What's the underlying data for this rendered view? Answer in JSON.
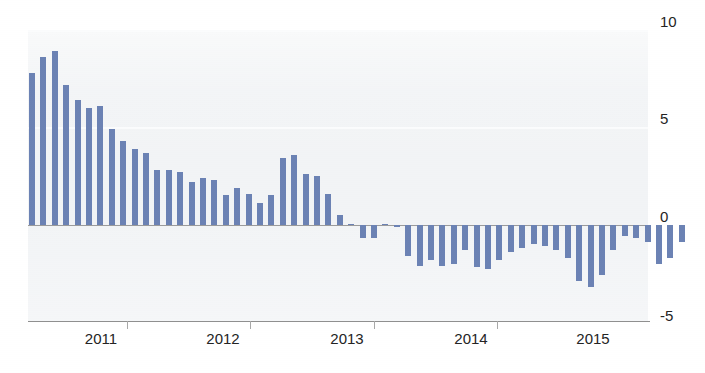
{
  "chart_data": {
    "type": "bar",
    "title": "",
    "subtitle": "",
    "xlabel": "",
    "ylabel": "",
    "ylim": [
      -5,
      10
    ],
    "yticks": [
      10,
      5,
      0,
      -5
    ],
    "ytick_labels": [
      "10",
      "5",
      "0",
      "-5"
    ],
    "xtick_labels": [
      "2011",
      "2012",
      "2013",
      "2014",
      "2015"
    ],
    "grid": "horizontal-light",
    "legend": "none",
    "series_color": "#6b82b4",
    "zero_line_color": "#9b9b9b",
    "panel_background": "#f2f4f6",
    "annotations": [],
    "n_points": 54,
    "x": [
      "2010-08",
      "2010-09",
      "2010-10",
      "2010-11",
      "2010-12",
      "2011-01",
      "2011-02",
      "2011-03",
      "2011-04",
      "2011-05",
      "2011-06",
      "2011-07",
      "2011-08",
      "2011-09",
      "2011-10",
      "2011-11",
      "2011-12",
      "2012-01",
      "2012-02",
      "2012-03",
      "2012-04",
      "2012-05",
      "2012-06",
      "2012-07",
      "2012-08",
      "2012-09",
      "2012-10",
      "2012-11",
      "2012-12",
      "2013-01",
      "2013-02",
      "2013-03",
      "2013-04",
      "2013-05",
      "2013-06",
      "2013-07",
      "2013-08",
      "2013-09",
      "2013-10",
      "2013-11",
      "2013-12",
      "2014-01",
      "2014-02",
      "2014-03",
      "2014-04",
      "2014-05",
      "2014-06",
      "2014-07",
      "2014-08",
      "2014-09",
      "2014-10",
      "2014-11",
      "2014-12",
      "2015-01"
    ],
    "values": [
      7.8,
      8.6,
      8.9,
      7.2,
      6.4,
      6.0,
      6.1,
      4.9,
      4.3,
      3.9,
      3.7,
      2.8,
      2.8,
      2.7,
      2.2,
      2.4,
      2.3,
      1.5,
      1.9,
      1.6,
      1.1,
      1.5,
      3.4,
      3.6,
      2.6,
      2.5,
      1.6,
      0.5,
      0.0,
      -0.7,
      -0.7,
      0.0,
      -0.1,
      -1.6,
      -2.1,
      -1.8,
      -2.1,
      -2.0,
      -1.3,
      -2.2,
      -2.3,
      -1.8,
      -1.4,
      -1.2,
      -1.0,
      -1.1,
      -1.3,
      -1.7,
      -2.9,
      -3.2,
      -2.6,
      -1.3,
      -0.6,
      -0.7
    ],
    "values_extra": [
      -0.9,
      -2.0,
      -1.7,
      -0.9
    ]
  },
  "axis": {
    "y_labels": [
      "10",
      "5",
      "0",
      "-5"
    ],
    "x_labels": [
      "2011",
      "2012",
      "2013",
      "2014",
      "2015"
    ]
  }
}
